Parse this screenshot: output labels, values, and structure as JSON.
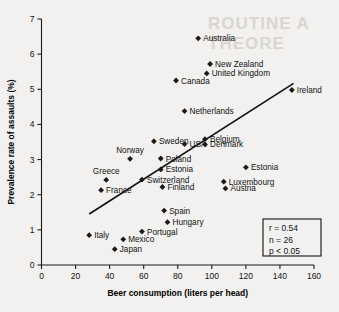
{
  "figure": {
    "background_color": "#f2f1ef",
    "ink_color": "#1a1a1a",
    "ghost_text_1": "ROUTINE A",
    "ghost_text_2": "THEORE"
  },
  "chart_data": {
    "type": "scatter",
    "title": "",
    "xlabel": "Beer consumption (liters per head)",
    "ylabel": "Prevalence rate of assaults (%)",
    "xlim": [
      0,
      160
    ],
    "ylim": [
      0,
      7
    ],
    "xticks": [
      0,
      20,
      40,
      60,
      80,
      100,
      120,
      140,
      160
    ],
    "yticks": [
      0,
      1,
      2,
      3,
      4,
      5,
      6,
      7
    ],
    "grid": false,
    "legend": "none",
    "marker_shape": "diamond",
    "points": [
      {
        "label": "Australia",
        "x": 92,
        "y": 6.45,
        "label_side": "right"
      },
      {
        "label": "New Zealand",
        "x": 99,
        "y": 5.72,
        "label_side": "right"
      },
      {
        "label": "United Kingdom",
        "x": 97,
        "y": 5.45,
        "label_side": "right"
      },
      {
        "label": "Canada",
        "x": 79,
        "y": 5.25,
        "label_side": "right"
      },
      {
        "label": "Ireland",
        "x": 147,
        "y": 4.98,
        "label_side": "right"
      },
      {
        "label": "Netherlands",
        "x": 84,
        "y": 4.38,
        "label_side": "right"
      },
      {
        "label": "Sweden",
        "x": 66,
        "y": 3.52,
        "label_side": "right"
      },
      {
        "label": "Belgium",
        "x": 96,
        "y": 3.58,
        "label_side": "right"
      },
      {
        "label": "USA",
        "x": 84,
        "y": 3.44,
        "label_side": "right"
      },
      {
        "label": "Denmark",
        "x": 96,
        "y": 3.43,
        "label_side": "right"
      },
      {
        "label": "Norway",
        "x": 52,
        "y": 3.02,
        "label_side": "above"
      },
      {
        "label": "Poland",
        "x": 70,
        "y": 3.03,
        "label_side": "right"
      },
      {
        "label": "Estonia",
        "x": 70,
        "y": 2.72,
        "label_side": "right"
      },
      {
        "label": "Estonia",
        "x": 120,
        "y": 2.78,
        "label_side": "right"
      },
      {
        "label": "Greece",
        "x": 38,
        "y": 2.42,
        "label_side": "above"
      },
      {
        "label": "Switzerland",
        "x": 59,
        "y": 2.43,
        "label_side": "right"
      },
      {
        "label": "Luxembourg",
        "x": 107,
        "y": 2.37,
        "label_side": "right"
      },
      {
        "label": "France",
        "x": 35,
        "y": 2.13,
        "label_side": "right"
      },
      {
        "label": "Finland",
        "x": 71,
        "y": 2.22,
        "label_side": "right"
      },
      {
        "label": "Austria",
        "x": 108,
        "y": 2.18,
        "label_side": "right"
      },
      {
        "label": "Spain",
        "x": 72,
        "y": 1.55,
        "label_side": "right"
      },
      {
        "label": "Hungary",
        "x": 74,
        "y": 1.22,
        "label_side": "right"
      },
      {
        "label": "Italy",
        "x": 28,
        "y": 0.85,
        "label_side": "right"
      },
      {
        "label": "Portugal",
        "x": 59,
        "y": 0.95,
        "label_side": "right"
      },
      {
        "label": "Mexico",
        "x": 48,
        "y": 0.73,
        "label_side": "right"
      },
      {
        "label": "Japan",
        "x": 43,
        "y": 0.45,
        "label_side": "right"
      }
    ],
    "trendline": {
      "x0": 28,
      "y0": 1.45,
      "x1": 148,
      "y1": 5.17
    },
    "annotations": {
      "stats_r": "r = 0.54",
      "stats_n": "n = 26",
      "stats_p": "p < 0.05"
    }
  }
}
